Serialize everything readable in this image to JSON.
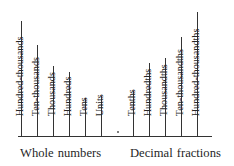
{
  "figure": {
    "decimal_point_symbol": ".",
    "axis": {
      "x_start": 18,
      "x_end": 212,
      "y": 136
    },
    "colors": {
      "line": "#333333",
      "text": "#262626",
      "background": "#ffffff"
    }
  },
  "groups": [
    {
      "id": "whole-numbers",
      "caption": "Whole numbers",
      "caption_x": 20,
      "caption_y": 147,
      "places": [
        {
          "label": "Hundred-thousands",
          "tick_x": 21,
          "tick_top": 21,
          "label_x": 25,
          "label_y": 116
        },
        {
          "label": "Ten-thousands",
          "tick_x": 37,
          "tick_top": 45,
          "label_x": 41,
          "label_y": 116
        },
        {
          "label": "Thousands",
          "tick_x": 53,
          "tick_top": 66,
          "label_x": 57,
          "label_y": 116
        },
        {
          "label": "Hundreds",
          "tick_x": 69,
          "tick_top": 72,
          "label_x": 73,
          "label_y": 116
        },
        {
          "label": "Tens",
          "tick_x": 85,
          "tick_top": 98,
          "label_x": 89,
          "label_y": 116
        },
        {
          "label": "Units",
          "tick_x": 101,
          "tick_top": 96,
          "label_x": 105,
          "label_y": 116
        }
      ]
    },
    {
      "id": "decimal-fractions",
      "caption": "Decimal fractions",
      "caption_x": 130,
      "caption_y": 147,
      "places": [
        {
          "label": "Tenths",
          "tick_x": 133,
          "tick_top": 91,
          "label_x": 137,
          "label_y": 116
        },
        {
          "label": "Hundredths",
          "tick_x": 149,
          "tick_top": 63,
          "label_x": 153,
          "label_y": 116
        },
        {
          "label": "Thousandths",
          "tick_x": 165,
          "tick_top": 58,
          "label_x": 169,
          "label_y": 116
        },
        {
          "label": "Ten-thousandths",
          "tick_x": 181,
          "tick_top": 37,
          "label_x": 185,
          "label_y": 116
        },
        {
          "label": "Hundred-thousandths",
          "tick_x": 197,
          "tick_top": 12,
          "label_x": 201,
          "label_y": 116
        }
      ]
    }
  ],
  "decimal_point": {
    "x": 117,
    "y": 131
  }
}
